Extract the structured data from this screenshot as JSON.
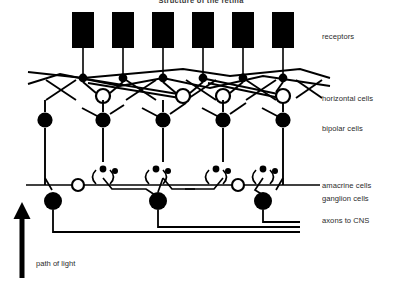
{
  "figure": {
    "title": "Structure of the retina",
    "background_color": "#ffffff",
    "ink_color": "#000000",
    "width": 402,
    "height": 291
  },
  "labels": {
    "receptors": "receptors",
    "horizontal_cells": "horizontal cells",
    "bipolar_cells": "bipolar cells",
    "amacrine_cells": "amacrine cells",
    "ganglion_cells": "ganglion cells",
    "axons_to_cns": "axons to CNS",
    "path_of_light": "path of light"
  },
  "label_positions": {
    "receptors": {
      "x": 322,
      "y": 32
    },
    "horizontal_cells": {
      "x": 322,
      "y": 94
    },
    "bipolar_cells": {
      "x": 322,
      "y": 124
    },
    "amacrine_cells": {
      "x": 322,
      "y": 181
    },
    "ganglion_cells": {
      "x": 322,
      "y": 194
    },
    "axons_to_cns": {
      "x": 322,
      "y": 216
    },
    "path_of_light": {
      "x": 36,
      "y": 259
    }
  },
  "diagram": {
    "receptor_columns_x": [
      83,
      123,
      163,
      203,
      243,
      283
    ],
    "receptor_box": {
      "width": 22,
      "height": 36,
      "top": 12,
      "fill": "#000000"
    },
    "receptor_terminal_y": 78,
    "receptor_terminal_r": 4.2,
    "horizontal_cell_y": 96,
    "horizontal_cell_r": 7,
    "horizontal_cells_x": [
      103,
      183,
      223,
      283
    ],
    "bipolar_cell_y": 120,
    "bipolar_cell_r": 7.5,
    "bipolar_cells_x": [
      45,
      103,
      163,
      223,
      283
    ],
    "amacrine_line_y": 185,
    "amacrine_cell_r": 6,
    "amacrine_cells_x": [
      78,
      238
    ],
    "ganglion_cell_y": 201,
    "ganglion_cell_r": 9,
    "ganglion_cells_x": [
      53,
      158,
      263
    ],
    "axon_lines_y": [
      222,
      227,
      232
    ],
    "axon_right_edge": 300,
    "light_arrow": {
      "x": 22,
      "top": 203,
      "bottom": 278,
      "shaft_width": 5
    }
  }
}
